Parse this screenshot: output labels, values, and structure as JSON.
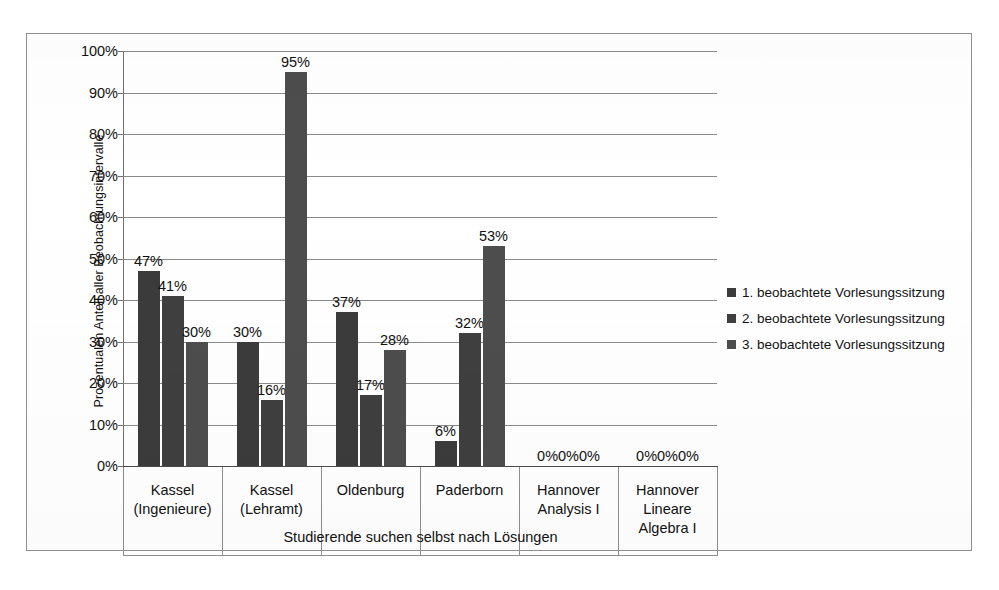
{
  "chart_data": {
    "type": "bar",
    "title": "",
    "xlabel": "Studierende suchen selbst nach Lösungen",
    "ylabel": "Prozentualen Anteil aller Beobachtungsintervalle",
    "ylim": [
      0,
      100
    ],
    "ytick_labels": [
      "100%",
      "90%",
      "80%",
      "70%",
      "60%",
      "50%",
      "40%",
      "30%",
      "20%",
      "10%",
      "0%"
    ],
    "ytick_values": [
      100,
      90,
      80,
      70,
      60,
      50,
      40,
      30,
      20,
      10,
      0
    ],
    "grid": true,
    "legend_position": "right",
    "categories": [
      "Kassel (Ingenieure)",
      "Kassel (Lehramt)",
      "Oldenburg",
      "Paderborn",
      "Hannover Analysis I",
      "Hannover Lineare Algebra I"
    ],
    "category_lines": [
      [
        "Kassel",
        "(Ingenieure)"
      ],
      [
        "Kassel",
        "(Lehramt)"
      ],
      [
        "Oldenburg"
      ],
      [
        "Paderborn"
      ],
      [
        "Hannover",
        "Analysis I"
      ],
      [
        "Hannover",
        "Lineare",
        "Algebra I"
      ]
    ],
    "series": [
      {
        "name": "1. beobachtete Vorlesungssitzung",
        "color": "#3b3b3b",
        "values": [
          47,
          30,
          37,
          6,
          0,
          0
        ],
        "labels": [
          "47%",
          "30%",
          "37%",
          "6%",
          "0%",
          "0%"
        ]
      },
      {
        "name": "2. beobachtete Vorlesungssitzung",
        "color": "#3f3f3f",
        "values": [
          41,
          16,
          17,
          32,
          0,
          0
        ],
        "labels": [
          "41%",
          "16%",
          "17%",
          "32%",
          "0%",
          "0%"
        ]
      },
      {
        "name": "3. beobachtete Vorlesungssitzung",
        "color": "#4d4d4d",
        "values": [
          30,
          95,
          28,
          53,
          0,
          0
        ],
        "labels": [
          "30%",
          "95%",
          "28%",
          "53%",
          "0%",
          "0%"
        ]
      }
    ],
    "zero_group_labels": [
      "0%0%0%",
      "0%0%0%"
    ]
  },
  "legend": {
    "items": [
      {
        "label": "1. beobachtete Vorlesungssitzung",
        "color": "#3b3b3b"
      },
      {
        "label": "2. beobachtete Vorlesungssitzung",
        "color": "#3f3f3f"
      },
      {
        "label": "3. beobachtete Vorlesungssitzung",
        "color": "#4d4d4d"
      }
    ]
  },
  "axis": {
    "y_title": "Prozentualen Anteil aller Beobachtungsintervalle",
    "x_title": "Studierende suchen selbst nach Lösungen"
  }
}
